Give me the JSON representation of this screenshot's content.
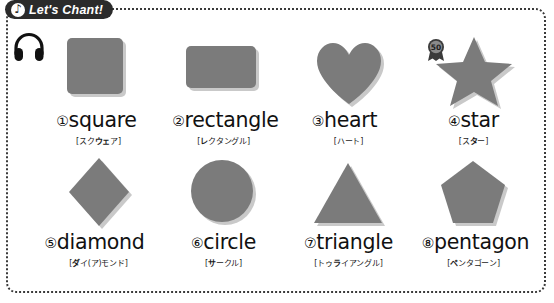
{
  "worksheet": {
    "title_badge": {
      "icon": "music-note-icon",
      "text": "Let's Chant!"
    },
    "headphone_icon": "headphone-icon",
    "rosette_badge": {
      "icon": "rosette-icon",
      "number": "50"
    },
    "shape_color": "#7b7b7b",
    "items": [
      {
        "number": "①",
        "word": "square",
        "katakana_pre": "[スク",
        "katakana_bold": "ウェ",
        "katakana_post": "ア]",
        "shape": "square-shape"
      },
      {
        "number": "②",
        "word": "rectangle",
        "katakana_pre": "[",
        "katakana_bold": "レ",
        "katakana_post": "クタングル]",
        "shape": "rectangle-shape"
      },
      {
        "number": "③",
        "word": "heart",
        "katakana_pre": "[ハ",
        "katakana_bold": "",
        "katakana_post": "ート]",
        "shape": "heart-shape"
      },
      {
        "number": "④",
        "word": "star",
        "katakana_pre": "[ス",
        "katakana_bold": "タ",
        "katakana_post": "ー]",
        "shape": "star-shape"
      },
      {
        "number": "⑤",
        "word": "diamond",
        "katakana_pre": "[",
        "katakana_bold": "ダ",
        "katakana_post": "イ(ア)モンド]",
        "shape": "diamond-shape"
      },
      {
        "number": "⑥",
        "word": "circle",
        "katakana_pre": "[",
        "katakana_bold": "サ",
        "katakana_post": "ークル]",
        "shape": "circle-shape"
      },
      {
        "number": "⑦",
        "word": "triangle",
        "katakana_pre": "[トゥ",
        "katakana_bold": "ラ",
        "katakana_post": "イアングル]",
        "shape": "triangle-shape"
      },
      {
        "number": "⑧",
        "word": "pentagon",
        "katakana_pre": "[",
        "katakana_bold": "ペ",
        "katakana_post": "ンタゴーン]",
        "shape": "pentagon-shape"
      }
    ]
  }
}
